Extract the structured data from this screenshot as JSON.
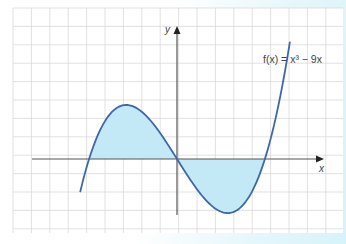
{
  "chart_data": {
    "type": "line",
    "title": "",
    "function_label": "f(x) = x³ − 9x",
    "xlabel": "x",
    "ylabel": "y",
    "grid": true,
    "shaded_regions": [
      {
        "from": -3,
        "to": 0,
        "side": "above x-axis"
      },
      {
        "from": 0,
        "to": 3,
        "side": "below x-axis"
      }
    ],
    "key_points": {
      "roots": [
        -3,
        0,
        3
      ],
      "local_max": {
        "x": -1.732,
        "y": 10.39
      },
      "local_min": {
        "x": 1.732,
        "y": -10.39
      }
    },
    "x_range": [
      -3.3,
      3.85
    ],
    "colors": {
      "curve": "#3d67a8",
      "fill": "#c3e9f6",
      "axis": "#555555",
      "grid": "#d9d9d9"
    }
  },
  "labels": {
    "x_axis": "x",
    "y_axis": "y",
    "function": "f(x) = x³ − 9x"
  }
}
